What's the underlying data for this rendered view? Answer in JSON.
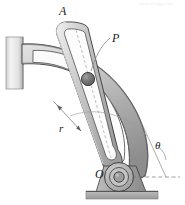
{
  "figure": {
    "type": "mechanical-diagram",
    "watermark": "www.chegg.com"
  },
  "labels": {
    "point_a": "A",
    "pin_p": "P",
    "radius_r": "r",
    "pivot_o": "O",
    "angle_theta": "θ"
  },
  "colors": {
    "outline": "#2b2b2b",
    "body_light": "#d4d4d4",
    "body_mid": "#a9a9a9",
    "body_dark": "#8a8a8a",
    "pin_fill": "#6e6e6e",
    "wall_light": "#f0f0f0",
    "wall_dark": "#b8b8b8",
    "ground": "#b0b0b0",
    "leader": "#777777",
    "background": "#ffffff"
  },
  "parts": {
    "wall_bracket": "wall-bracket",
    "curved_slotted_arm": "curved-slotted-arm",
    "straight_slotted_link": "straight-slotted-link",
    "pin_joint": "pin-joint-P",
    "pivot_joint": "pivot-joint-O",
    "base_pedestal": "base-pedestal",
    "ground_strip": "ground-strip",
    "dimension_line_r": "dimension-line-r",
    "angle_arc_theta": "angle-arc-theta",
    "datum_line": "horizontal-datum-line"
  }
}
